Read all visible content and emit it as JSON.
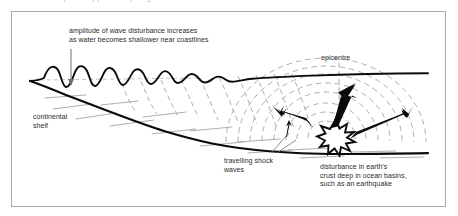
{
  "page": {
    "width": 458,
    "height": 216,
    "background_color": "#ffffff",
    "border_color": "#a9a9ad",
    "ink_color": "#000000",
    "text_color": "#2b2b2e",
    "dash_color": "#9a9a9e",
    "clipped_top_text": "illustration caption clipped at top edge"
  },
  "diagram": {
    "type": "cross-section",
    "labels": {
      "amplitude": "amplitude of wave disturbance increases\nas water becomes shallower near coastlines",
      "continental_shelf": "continental\nshelf",
      "travelling_shock_waves": "travelling shock\nwaves",
      "epicentre": "epicentre",
      "disturbance": "disturbance in earth's\ncrust deep in ocean basins,\nsuch as an earthquake"
    },
    "features": [
      {
        "name": "ocean-surface-wave-train",
        "description": "wave amplitude grows toward the left (shallow water near coast)"
      },
      {
        "name": "sea-floor-profile",
        "description": "continental shelf rising from deep ocean basin on the right"
      },
      {
        "name": "wavefront-dashes",
        "description": "dashed lines linking surface crests down to the sea floor"
      },
      {
        "name": "concentric-shock-arcs",
        "description": "dashed arcs radiating from the earthquake focus"
      },
      {
        "name": "starburst",
        "description": "jagged burst marking the earthquake in the crust"
      },
      {
        "name": "energy-arrows",
        "description": "three heavy arrows: left, upward, and up-right from the focus"
      },
      {
        "name": "epicentre-dashed-line",
        "description": "vertical dashed line from the epicentre label to the focus"
      },
      {
        "name": "amplitude-pointer-arrow",
        "description": "thin downward arrow from the amplitude caption to a wave trough"
      }
    ]
  }
}
